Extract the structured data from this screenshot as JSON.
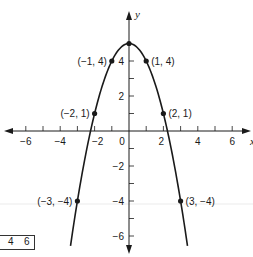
{
  "chart_data": {
    "type": "line",
    "title": "",
    "function": "y = 5 - x^2",
    "xlabel": "x",
    "ylabel": "y",
    "xlim": [
      -7,
      7
    ],
    "ylim": [
      -7,
      6
    ],
    "grid": false,
    "x_ticks": [
      -6,
      -4,
      -2,
      0,
      2,
      4,
      6
    ],
    "x_minor_ticks": [
      -6,
      -5,
      -4,
      -3,
      -2,
      -1,
      1,
      2,
      3,
      4,
      5,
      6
    ],
    "y_ticks": [
      -6,
      -4,
      -2,
      2,
      4
    ],
    "y_minor_ticks": [
      -6,
      -5,
      -4,
      -3,
      -2,
      -1,
      1,
      2,
      3,
      4
    ],
    "series": [
      {
        "name": "parabola",
        "x": [
          -3.4,
          -3,
          -2,
          -1,
          0,
          1,
          2,
          3,
          3.4
        ],
        "y": [
          -6.56,
          -4,
          1,
          4,
          5,
          4,
          1,
          -4,
          -6.56
        ]
      }
    ],
    "points": [
      {
        "x": 0,
        "y": 5,
        "label": ""
      },
      {
        "x": -1,
        "y": 4,
        "label": "(−1, 4)"
      },
      {
        "x": 1,
        "y": 4,
        "label": "(1, 4)"
      },
      {
        "x": -2,
        "y": 1,
        "label": "(−2, 1)"
      },
      {
        "x": 2,
        "y": 1,
        "label": "(2, 1)"
      },
      {
        "x": -3,
        "y": -4,
        "label": "(−3, −4)"
      },
      {
        "x": 3,
        "y": -4,
        "label": "(3, −4)"
      }
    ],
    "color": "#1a1a1a"
  },
  "fragment": {
    "values": [
      "4",
      "6"
    ]
  }
}
